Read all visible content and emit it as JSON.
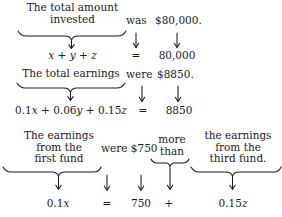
{
  "figure": {
    "ink_color": "#1a1a1a",
    "background": "#ffffff"
  },
  "rows": [
    {
      "id": "row1",
      "phrase": "The total amount\ninvested",
      "connector": "was",
      "value_phrase": "$80,000.",
      "expression": "x + y + z",
      "relation": "=",
      "value": "80,000"
    },
    {
      "id": "row2",
      "phrase": "The total earnings",
      "connector": "were",
      "value_phrase": "$8850.",
      "expression": "0.1x + 0.06y + 0.15z",
      "relation": "=",
      "value": "8850"
    },
    {
      "id": "row3",
      "phrase": "The earnings\nfrom the\nfirst fund",
      "connector": "were $750",
      "comparator_phrase": "more\nthan",
      "second_phrase": "the earnings\nfrom the\nthird fund.",
      "expression": "0.1x",
      "relation": "=",
      "value": "750",
      "operator": "+",
      "second_expression": "0.15z"
    }
  ],
  "glyphs": {
    "down_arrow": "down-arrow",
    "under_brace": "under-brace"
  }
}
